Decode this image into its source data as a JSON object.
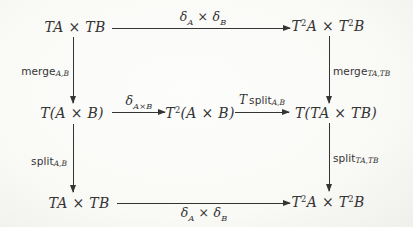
{
  "page": {
    "paper_color": "#f9f9f7",
    "ink_color": "#343434",
    "figure_kind": "commutative-diagram"
  },
  "nodes": {
    "top_left": {
      "math": "TA × TB"
    },
    "top_right": {
      "math": "T^{2}A × T^{2}B"
    },
    "mid_left": {
      "math": "T(A × B)"
    },
    "mid_center": {
      "math": "T^{2}(A × B)"
    },
    "mid_right": {
      "math": "T(TA × TB)"
    },
    "bottom_left": {
      "math": "TA × TB"
    },
    "bottom_right": {
      "math": "T^{2}A × T^{2}B"
    }
  },
  "arrows": {
    "top": {
      "direction": "right",
      "from": "TA × TB",
      "to": "T^2A × T^2B",
      "label_math": "δ_{A} × δ_{B}"
    },
    "mid_first": {
      "direction": "right",
      "from": "T(A × B)",
      "to": "T^2(A × B)",
      "label_math": "δ_{A×B}"
    },
    "mid_second": {
      "direction": "right",
      "from": "T^2(A × B)",
      "to": "T(TA × TB)",
      "label_prefix_math": "T",
      "label_name": "split",
      "label_sub": "A,B"
    },
    "bottom": {
      "direction": "right",
      "from": "TA × TB",
      "to": "T^2A × T^2B",
      "label_math": "δ_{A} × δ_{B}"
    },
    "left_upper": {
      "direction": "down",
      "from": "TA × TB",
      "to": "T(A × B)",
      "label_name": "merge",
      "label_sub": "A,B"
    },
    "left_lower": {
      "direction": "down",
      "from": "T(A × B)",
      "to": "TA × TB",
      "label_name": "split",
      "label_sub": "A,B"
    },
    "right_upper": {
      "direction": "down",
      "from": "T^2A × T^2B",
      "to": "T(TA × TB)",
      "label_name": "merge",
      "label_sub": "TA,TB"
    },
    "right_lower": {
      "direction": "down",
      "from": "T(TA × TB)",
      "to": "T^2A × T^2B",
      "label_name": "split",
      "label_sub": "TA,TB"
    }
  }
}
